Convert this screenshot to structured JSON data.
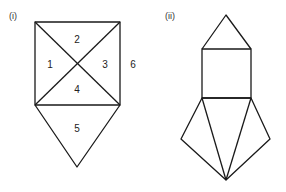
{
  "figures": [
    {
      "label": "(i)",
      "regions": [
        "1",
        "2",
        "3",
        "4",
        "5",
        "6"
      ],
      "description": "Square divided by its two diagonals into four triangles (1-4), with a triangle (5) attached below; region 6 is outside the square on the right"
    },
    {
      "label": "(ii)",
      "description": "Triangle on top of a square, with a fan of three triangles below meeting at a single bottom vertex"
    }
  ]
}
